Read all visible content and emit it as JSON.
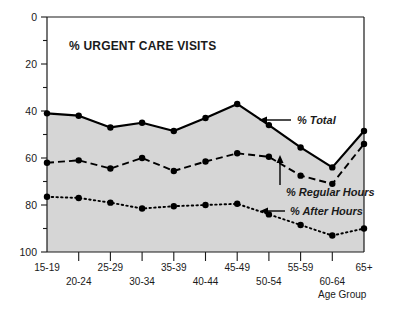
{
  "chart_data": {
    "type": "line",
    "title": "% URGENT CARE VISITS",
    "xlabel": "Age Group",
    "ylabel": "",
    "ylim": [
      0,
      100
    ],
    "yticks": [
      0,
      20,
      40,
      60,
      80,
      100
    ],
    "yticks_minor": [
      10,
      30,
      50,
      70,
      90
    ],
    "grid": false,
    "legend_position": "inline-annotations",
    "categories": [
      "15-19",
      "20-24",
      "25-29",
      "30-34",
      "35-39",
      "40-44",
      "45-49",
      "50-54",
      "55-59",
      "60-64",
      "65+"
    ],
    "series": [
      {
        "name": "% Total",
        "style": "solid",
        "values": [
          59,
          58,
          53,
          55,
          51.5,
          57,
          63,
          54,
          44.5,
          36,
          51.5
        ]
      },
      {
        "name": "% Regular Hours",
        "style": "dashed",
        "values": [
          38,
          39,
          35.5,
          40,
          34.5,
          38.5,
          42,
          40.5,
          32.5,
          29,
          46
        ]
      },
      {
        "name": "% After Hours",
        "style": "dotted",
        "values": [
          23.5,
          23,
          21,
          18.5,
          19.5,
          20,
          20.5,
          16,
          11.5,
          7,
          10
        ]
      }
    ],
    "annotations": [
      {
        "text": "% Total",
        "arrow": "left"
      },
      {
        "text": "% Regular Hours",
        "arrow": "up"
      },
      {
        "text": "% After Hours",
        "arrow": "left"
      }
    ],
    "fill_color": "#d6d6d6",
    "line_color": "#000000"
  },
  "axis": {
    "y_labels": [
      "100",
      "80",
      "60",
      "40",
      "20",
      "0"
    ],
    "x_labels_top_row": [
      "15-19",
      "25-29",
      "35-39",
      "45-49",
      "55-59",
      "65+"
    ],
    "x_labels_bottom_row": [
      "20-24",
      "30-34",
      "40-44",
      "50-54",
      "60-64"
    ],
    "x_title": "Age Group"
  },
  "labels": {
    "title": "% URGENT CARE VISITS",
    "total": "% Total",
    "regular": "% Regular Hours",
    "after": "% After Hours"
  }
}
